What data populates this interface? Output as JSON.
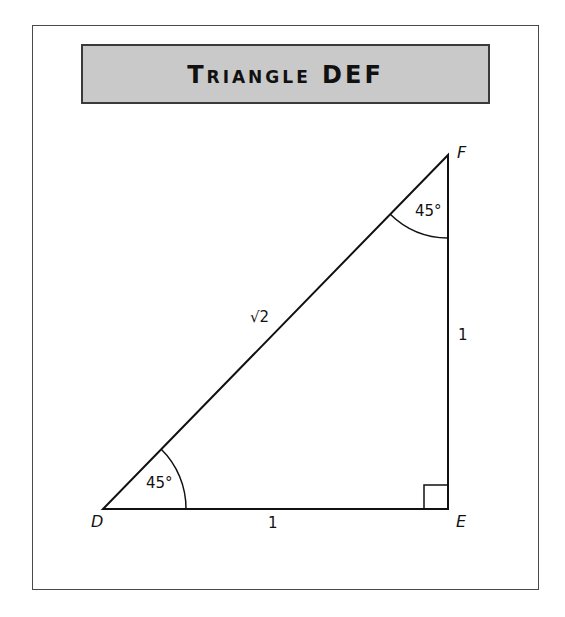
{
  "title": "Triangle DEF",
  "colors": {
    "header_fill": "#c9c9c9",
    "stroke": "#111111",
    "frame": "#4a4a4a"
  },
  "triangle": {
    "vertices": {
      "D": {
        "label": "D"
      },
      "E": {
        "label": "E"
      },
      "F": {
        "label": "F"
      }
    },
    "sides": {
      "DE": {
        "label": "1"
      },
      "EF": {
        "label": "1"
      },
      "DF": {
        "label": "√2"
      }
    },
    "angles": {
      "D": {
        "label": "45°"
      },
      "F": {
        "label": "45°"
      },
      "E": {
        "marker": "right-angle"
      }
    }
  }
}
